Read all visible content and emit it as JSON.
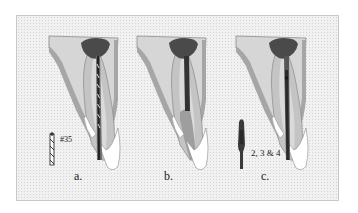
{
  "figure": {
    "panels": [
      {
        "id": "a",
        "label": "a.",
        "instrument_label": "#35",
        "description": "File #35 in canal with spiral instrument"
      },
      {
        "id": "b",
        "label": "b.",
        "instrument_label": "",
        "description": "Filled canal (dark core) with apical region"
      },
      {
        "id": "c",
        "label": "c.",
        "instrument_label": "2, 3 & 4",
        "description": "Drills/reamers 2, 3 & 4 in canal"
      }
    ]
  },
  "colors": {
    "background": "#f1f1f1",
    "bone": "#d9d9d9",
    "outline_band": "#a8a8a8",
    "root": "#c6c6c6",
    "pulp_chamber": "#4a4a4a",
    "canal": "#3c3c3c",
    "crown_white": "#ffffff",
    "apical": "#9e9e9e"
  }
}
